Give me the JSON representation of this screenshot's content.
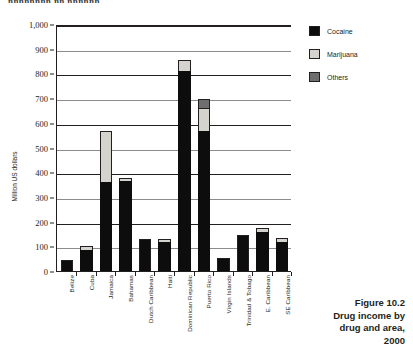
{
  "running_head": "nnnnnnnn nn nnnnnn",
  "caption": {
    "figure_number": "Figure 10.2",
    "line1": "Drug income by",
    "line2": "drug and area,",
    "line3": "2000"
  },
  "legend": {
    "items": [
      {
        "label": "Cocaine",
        "color": "#0d0d0d",
        "swatch": "cocaine"
      },
      {
        "label": "Marijuana",
        "color": "#d4d3ce",
        "swatch": "marijuana"
      },
      {
        "label": "Others",
        "color": "#6e6e6e",
        "swatch": "others"
      }
    ]
  },
  "chart_data": {
    "type": "bar",
    "stacked": true,
    "title": "Drug income by drug and area, 2000",
    "xlabel": "",
    "ylabel": "Million US dollars",
    "ylim": [
      0,
      1000
    ],
    "yticks": [
      0,
      100,
      200,
      300,
      400,
      500,
      600,
      700,
      800,
      900,
      1000
    ],
    "ytick_labels": [
      "0",
      "100",
      "200",
      "300",
      "400",
      "500",
      "600",
      "700",
      "800",
      "900",
      "1,000"
    ],
    "grid": true,
    "legend_position": "right",
    "categories": [
      "Belize",
      "Cuba",
      "Jamaica",
      "Bahamas",
      "Dutch Caribbean",
      "Haiti",
      "Dominican Republic",
      "Puerto Rico",
      "Virgin Islands",
      "Trinidad & Tobago",
      "E. Caribbean",
      "SE Caribbean"
    ],
    "series": [
      {
        "name": "Cocaine",
        "color": "#0d0d0d",
        "values": [
          50,
          90,
          365,
          370,
          135,
          120,
          815,
          572,
          55,
          150,
          160,
          120
        ]
      },
      {
        "name": "Marijuana",
        "color": "#d4d3ce",
        "values": [
          0,
          15,
          205,
          12,
          0,
          12,
          45,
          93,
          0,
          0,
          20,
          17
        ]
      },
      {
        "name": "Others",
        "color": "#6e6e6e",
        "values": [
          0,
          0,
          0,
          0,
          0,
          0,
          0,
          37,
          0,
          0,
          0,
          0
        ]
      }
    ],
    "totals": [
      50,
      105,
      570,
      382,
      135,
      132,
      860,
      702,
      55,
      150,
      180,
      137
    ]
  }
}
